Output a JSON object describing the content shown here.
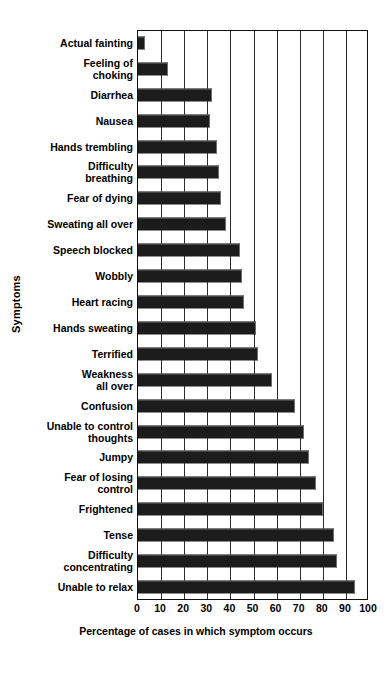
{
  "chart_data": {
    "type": "bar",
    "orientation": "horizontal",
    "title": "",
    "xlabel": "Percentage of cases in which symptom occurs",
    "ylabel": "Symptoms",
    "xlim": [
      0,
      100
    ],
    "xticks": [
      0,
      10,
      20,
      30,
      40,
      50,
      60,
      70,
      80,
      90,
      100
    ],
    "xtick_labels": [
      "0",
      "10",
      "20",
      "30",
      "40",
      "50",
      "60",
      "70",
      "80",
      "90",
      "100"
    ],
    "grid": "vertical",
    "legend": null,
    "bar_color": "#1c1c1c",
    "categories": [
      "Actual fainting",
      "Feeling of\nchoking",
      "Diarrhea",
      "Nausea",
      "Hands trembling",
      "Difficulty\nbreathing",
      "Fear of dying",
      "Sweating all over",
      "Speech blocked",
      "Wobbly",
      "Heart racing",
      "Hands sweating",
      "Terrified",
      "Weakness\nall over",
      "Confusion",
      "Unable to control\nthoughts",
      "Jumpy",
      "Fear of losing\ncontrol",
      "Frightened",
      "Tense",
      "Difficulty\nconcentrating",
      "Unable to relax"
    ],
    "values": [
      3,
      13,
      32,
      31,
      34,
      35,
      36,
      38,
      44,
      45,
      46,
      51,
      52,
      58,
      68,
      72,
      74,
      77,
      80,
      85,
      86,
      94
    ]
  }
}
